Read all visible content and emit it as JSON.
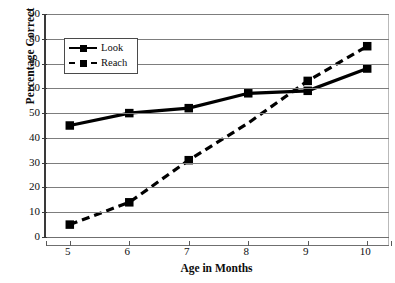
{
  "chart_data": {
    "type": "line",
    "title": "",
    "xlabel": "Age in Months",
    "ylabel": "Percentage Correct",
    "x": [
      5,
      6,
      7,
      8,
      9,
      10
    ],
    "xtick_labels": [
      "5",
      "6",
      "7",
      "8",
      "9",
      "10"
    ],
    "ytick_labels": [
      "0",
      "10",
      "20",
      "30",
      "40",
      "50",
      "60",
      "70",
      "80",
      "90"
    ],
    "yticks": [
      0,
      10,
      20,
      30,
      40,
      50,
      60,
      70,
      80,
      90
    ],
    "xlim": [
      4.6,
      10.4
    ],
    "ylim": [
      0,
      90
    ],
    "grid": "horizontal",
    "legend_position": "upper-left-inside",
    "series": [
      {
        "name": "Look",
        "style": "solid",
        "marker": "square",
        "color": "#000000",
        "values": [
          45,
          50,
          52,
          58,
          59,
          68
        ],
        "markers_shown": [
          true,
          true,
          true,
          true,
          true,
          true
        ]
      },
      {
        "name": "Reach",
        "style": "dashed",
        "marker": "square",
        "color": "#000000",
        "values": [
          5,
          14,
          31,
          46,
          63,
          77
        ],
        "markers_shown": [
          true,
          true,
          true,
          false,
          true,
          true
        ]
      }
    ]
  },
  "axes": {
    "y_title": "Percentage Correct",
    "x_title": "Age in Months"
  },
  "legend": {
    "items": [
      {
        "label": "Look",
        "style": "solid"
      },
      {
        "label": "Reach",
        "style": "dashed"
      }
    ]
  },
  "colors": {
    "series": "#000000",
    "gridline": "#7d7d7d",
    "axis": "#3a3a3a",
    "background": "#ffffff"
  }
}
